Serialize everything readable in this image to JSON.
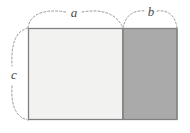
{
  "figure": {
    "background_color": "#ffffff",
    "labels": {
      "a": "a",
      "b": "b",
      "c": "c"
    },
    "regions": [
      {
        "name": "left-region",
        "label_ref": "a",
        "fill_color": "#f2f2f0",
        "stroke_color": "#808080",
        "x": 28,
        "y": 28,
        "width": 95,
        "height": 92
      },
      {
        "name": "right-region",
        "label_ref": "b",
        "fill_color": "#aaaaaa",
        "stroke_color": "#808080",
        "x": 123,
        "y": 28,
        "width": 54,
        "height": 92
      }
    ],
    "divider": {
      "name": "vertical-divider",
      "x": 123,
      "y1": 28,
      "y2": 120,
      "stroke_color": "#808080"
    },
    "braces": [
      {
        "name": "brace-a",
        "label_ref": "a",
        "orientation": "top",
        "spans": "left edge to divider",
        "from_x": 28,
        "to_x": 123,
        "label_x": 74,
        "label_y": 14,
        "stroke_color": "#9a9a9a",
        "dash": "2 2"
      },
      {
        "name": "brace-b",
        "label_ref": "b",
        "orientation": "top",
        "spans": "divider to right edge",
        "from_x": 123,
        "to_x": 177,
        "label_x": 151,
        "label_y": 13,
        "stroke_color": "#9a9a9a",
        "dash": "2 2"
      },
      {
        "name": "brace-c",
        "label_ref": "c",
        "orientation": "left",
        "spans": "top edge to bottom edge",
        "from_y": 28,
        "to_y": 120,
        "label_x": 14,
        "label_y": 76,
        "stroke_color": "#9a9a9a",
        "dash": "2 2"
      }
    ],
    "colors": {
      "light_fill": "#f2f2f0",
      "dark_fill": "#aaaaaa",
      "border": "#808080",
      "brace": "#9a9a9a",
      "label_text": "#4a4a4a"
    }
  }
}
